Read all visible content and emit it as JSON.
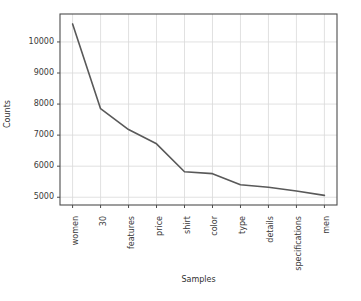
{
  "chart_data": {
    "type": "line",
    "title": "",
    "xlabel": "Samples",
    "ylabel": "Counts",
    "categories": [
      "women",
      "30",
      "features",
      "price",
      "shirt",
      "color",
      "type",
      "details",
      "specifications",
      "men"
    ],
    "values": [
      10580,
      7850,
      7180,
      6720,
      5820,
      5760,
      5400,
      5320,
      5200,
      5060
    ],
    "series": [
      {
        "name": "Counts",
        "values": [
          10580,
          7850,
          7180,
          6720,
          5820,
          5760,
          5400,
          5320,
          5200,
          5060
        ]
      }
    ],
    "ylim": [
      4750,
      10900
    ],
    "xlim": [
      -0.45,
      9.45
    ],
    "yticks": [
      5000,
      6000,
      7000,
      8000,
      9000,
      10000
    ],
    "ytick_labels": [
      "5000",
      "6000",
      "7000",
      "8000",
      "9000",
      "10000"
    ],
    "grid": true,
    "grid_color": "#d9d9d9",
    "legend": null,
    "legend_position": "none",
    "line_color": "#595959",
    "line_width": 1.6,
    "axes_color": "#4d4d4d",
    "background": "#ffffff",
    "xtick_rotation": -90
  }
}
